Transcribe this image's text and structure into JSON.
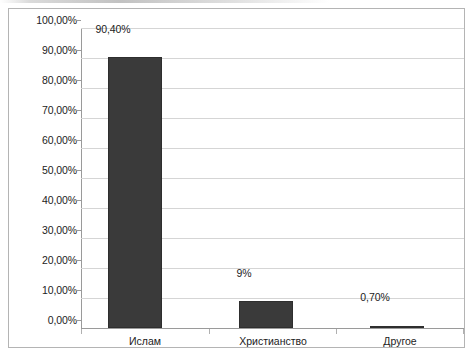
{
  "chart_data": {
    "type": "bar",
    "title": "",
    "subtitle": "",
    "xlabel": "",
    "ylabel": "",
    "categories": [
      "Ислам",
      "Христианство",
      "Другое"
    ],
    "values": [
      90.4,
      9.0,
      0.7
    ],
    "data_labels": [
      "90,40%",
      "9%",
      "0,70%"
    ],
    "ylim": [
      0,
      100
    ],
    "ytick_values": [
      0,
      10,
      20,
      30,
      40,
      50,
      60,
      70,
      80,
      90,
      100
    ],
    "ytick_labels": [
      "0,00%",
      "10,00%",
      "20,00%",
      "30,00%",
      "40,00%",
      "50,00%",
      "60,00%",
      "70,00%",
      "80,00%",
      "90,00%",
      "100,00%"
    ],
    "grid": true,
    "grid_axis": "y",
    "legend": false,
    "legend_position": "none",
    "series": [
      {
        "name": "",
        "values": [
          90.4,
          9.0,
          0.7
        ]
      }
    ],
    "colors": {
      "bar_fill": "#3a3a3a",
      "bar_border": "#2e2e2e",
      "gridline": "#d5d5d5",
      "axis_line": "#9a9a9a",
      "frame_border": "#b4b4b4",
      "text": "#1c1c1c",
      "background": "#ffffff"
    }
  }
}
